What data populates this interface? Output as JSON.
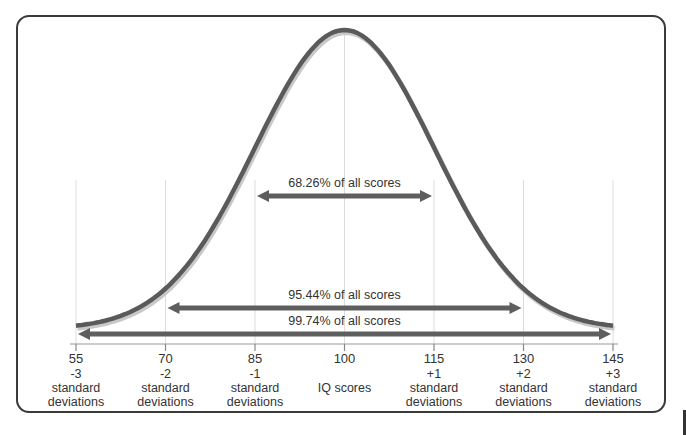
{
  "chart_data": {
    "type": "line",
    "title": "",
    "subtitle": "",
    "xlabel": "IQ scores",
    "ylabel": "",
    "distribution": "normal",
    "mean": 100,
    "std_dev": 15,
    "xlim": [
      55,
      145
    ],
    "grid": "vertical lines at each standard deviation",
    "ticks": [
      {
        "value": 55,
        "label": "55",
        "sd": "-3",
        "desc": "standard deviations"
      },
      {
        "value": 70,
        "label": "70",
        "sd": "-2",
        "desc": "standard deviations"
      },
      {
        "value": 85,
        "label": "85",
        "sd": "-1",
        "desc": "standard deviations"
      },
      {
        "value": 100,
        "label": "100",
        "sd": "",
        "desc": "IQ scores"
      },
      {
        "value": 115,
        "label": "115",
        "sd": "+1",
        "desc": "standard deviations"
      },
      {
        "value": 130,
        "label": "130",
        "sd": "+2",
        "desc": "standard deviations"
      },
      {
        "value": 145,
        "label": "145",
        "sd": "+3",
        "desc": "standard deviations"
      }
    ],
    "annotations": [
      {
        "text": "68.26% of all scores",
        "from": 85,
        "to": 115
      },
      {
        "text": "95.44% of all scores",
        "from": 70,
        "to": 130
      },
      {
        "text": "99.74% of all scores",
        "from": 55,
        "to": 145
      }
    ],
    "colors": {
      "curve": "#5a5a5a",
      "curve_shadow": "#c8c8c8",
      "arrow": "#5e5e5e",
      "grid": "#dcdcdc",
      "frame": "#3a3a3a"
    }
  }
}
